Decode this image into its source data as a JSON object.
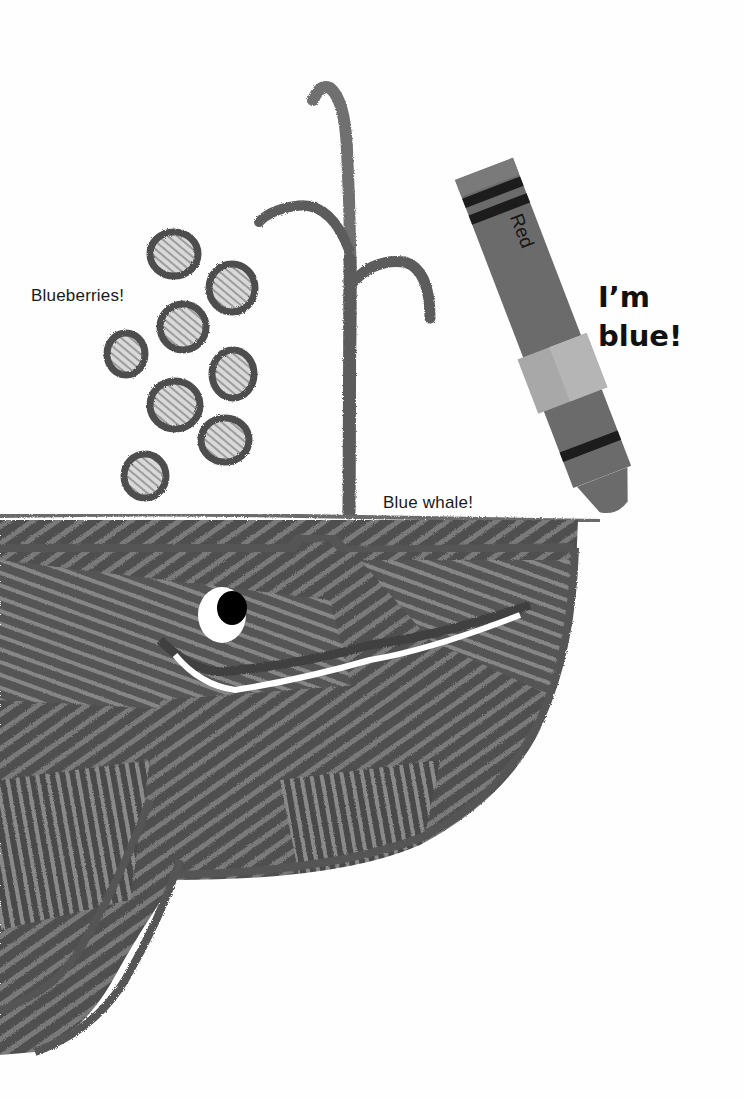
{
  "page": {
    "type": "picture-book illustration"
  },
  "labels": {
    "blueberries": "Blueberries!",
    "blue_whale": "Blue whale!",
    "speech_line1": "I’m",
    "speech_line2": "blue!"
  },
  "crayon": {
    "wrapper_text": "Red",
    "body_color": "#6b6b6b",
    "band_color": "#1c1c1c",
    "tape_color": "#a8a8a8"
  },
  "drawing": {
    "crayon_stroke_color": "#555555",
    "eye_pupil_color": "#000000",
    "eye_white_color": "#ffffff",
    "blueberry_count": 8
  }
}
